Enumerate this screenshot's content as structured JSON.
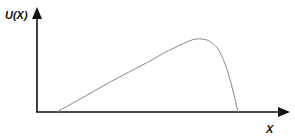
{
  "chart_data": {
    "type": "line",
    "title": "",
    "xlabel": "X",
    "ylabel": "U(X)",
    "grid": false,
    "legend": null,
    "x": [
      0.0,
      0.1,
      0.2,
      0.3,
      0.4,
      0.5,
      0.6,
      0.65,
      0.7,
      0.75,
      0.8,
      0.85,
      0.9,
      0.95,
      1.0
    ],
    "values": [
      0.0,
      0.14,
      0.28,
      0.42,
      0.55,
      0.68,
      0.82,
      0.88,
      0.94,
      0.99,
      1.0,
      0.96,
      0.82,
      0.5,
      0.0
    ]
  },
  "axes": {
    "y_label": "U(X)",
    "x_label": "X"
  },
  "colors": {
    "axis": "#111111",
    "curve": "#888888"
  }
}
